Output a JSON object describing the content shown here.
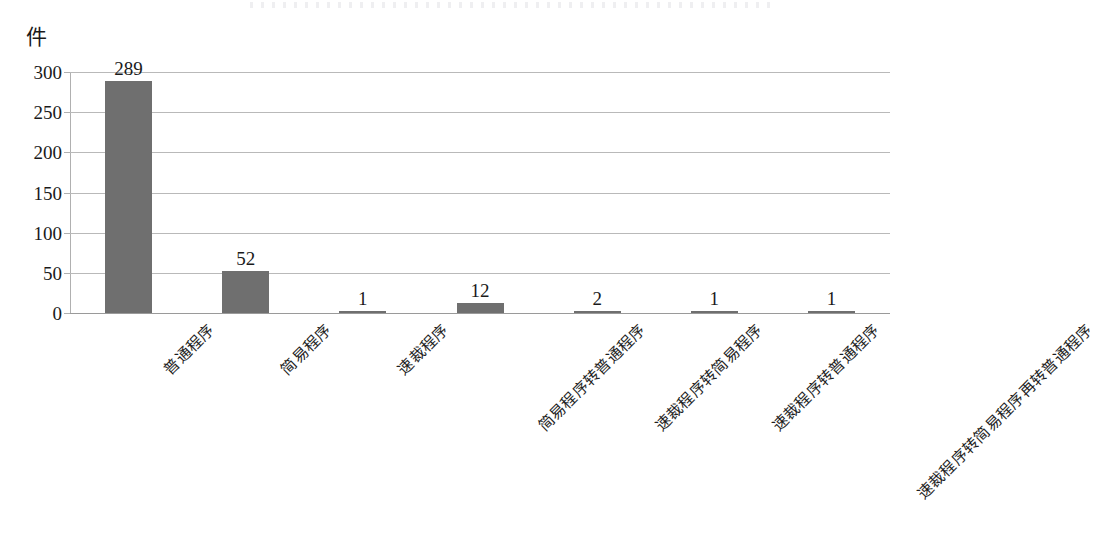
{
  "chart_data": {
    "type": "bar",
    "title": "",
    "subtitle": "",
    "unit_label": "件",
    "xlabel": "",
    "ylabel": "",
    "ylim": [
      0,
      300
    ],
    "grid": true,
    "legend": false,
    "legend_position": "none",
    "bar_color": "#6f6f6f",
    "gridline_color": "#b9b9b9",
    "label_rotation_deg": -45,
    "y_ticks": [
      "0",
      "50",
      "100",
      "150",
      "200",
      "250",
      "300"
    ],
    "y_tick_values": [
      0,
      50,
      100,
      150,
      200,
      250,
      300
    ],
    "categories": [
      "普通程序",
      "简易程序",
      "速裁程序",
      "简易程序转普通程序",
      "速裁程序转简易程序",
      "速裁程序转普通程序",
      "速裁程序转简易程序再转普通程序"
    ],
    "values": [
      289,
      52,
      1,
      12,
      2,
      1,
      1
    ],
    "value_labels": [
      "289",
      "52",
      "1",
      "12",
      "2",
      "1",
      "1"
    ]
  }
}
